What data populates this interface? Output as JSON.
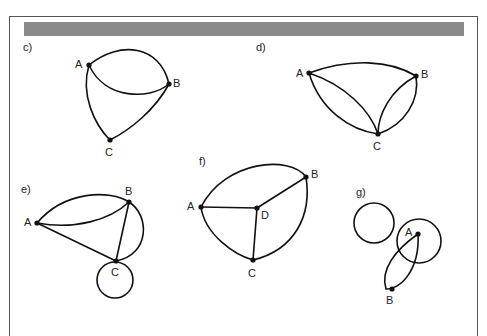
{
  "figure": {
    "panels": [
      {
        "id": "c",
        "label": "c)",
        "nodes": [
          "A",
          "B",
          "C"
        ]
      },
      {
        "id": "d",
        "label": "d)",
        "nodes": [
          "A",
          "B",
          "C"
        ]
      },
      {
        "id": "e",
        "label": "e)",
        "nodes": [
          "A",
          "B",
          "C"
        ]
      },
      {
        "id": "f",
        "label": "f)",
        "nodes": [
          "A",
          "B",
          "C",
          "D"
        ]
      },
      {
        "id": "g",
        "label": "g)",
        "nodes": [
          "A",
          "B"
        ]
      }
    ]
  }
}
